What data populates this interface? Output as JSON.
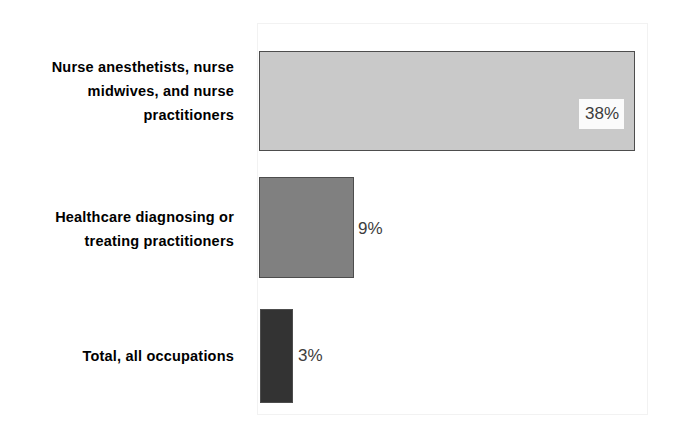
{
  "chart_data": {
    "type": "bar",
    "orientation": "horizontal",
    "title": "",
    "subtitle": "",
    "xlabel": "",
    "ylabel": "",
    "categories": [
      "Nurse anesthetists, nurse midwives, and nurse practitioners",
      "Healthcare diagnosing or treating practitioners",
      "Total, all occupations"
    ],
    "values": [
      38,
      9,
      3
    ],
    "value_labels": [
      "38%",
      "9%",
      "3%"
    ],
    "unit": "%",
    "xlim": [
      0,
      40
    ],
    "grid": false,
    "legend": null,
    "series": [
      {
        "name": "Percent change",
        "values": [
          38,
          9,
          3
        ]
      }
    ],
    "bar_colors": [
      "#c9c9c9",
      "#808080",
      "#333333"
    ],
    "bar_border_color": "#4d4d4d",
    "plot_border_color": "#f2f2f2",
    "background": "#ffffff",
    "label_color": "#000000",
    "value_label_color": "#3d3d3d"
  },
  "categories": [
    {
      "label": "Nurse anesthetists, nurse midwives, and nurse practitioners",
      "value_label": "38%"
    },
    {
      "label": "Healthcare diagnosing or treating practitioners",
      "value_label": "9%"
    },
    {
      "label": "Total, all occupations",
      "value_label": "3%"
    }
  ]
}
